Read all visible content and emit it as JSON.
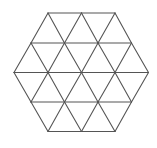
{
  "diagram": {
    "title": "",
    "stroke_color": "#555555",
    "background": "#ffffff",
    "rows": [
      {
        "y": 13,
        "xs": [
          48,
          81.5,
          115
        ]
      },
      {
        "y": 43,
        "xs": [
          31,
          64.5,
          98,
          131.5
        ]
      },
      {
        "y": 72.5,
        "xs": [
          14,
          48,
          81.5,
          115,
          148.5
        ]
      },
      {
        "y": 102,
        "xs": [
          31,
          64.5,
          98,
          131.5
        ]
      },
      {
        "y": 131.5,
        "xs": [
          48,
          81.5,
          115
        ]
      }
    ]
  }
}
